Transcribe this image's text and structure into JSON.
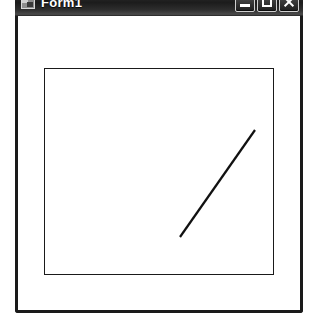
{
  "window": {
    "title": "Form1",
    "icon": "form-app-icon",
    "frame_color": "#1a1a1a",
    "titlebar_color": "#262626",
    "titlebar_text_color": "#ffffff",
    "client_background": "#ffffff"
  },
  "controls": {
    "minimize": {
      "name": "minimize-button",
      "icon": "minimize-icon",
      "label": "Minimize"
    },
    "maximize": {
      "name": "maximize-button",
      "icon": "maximize-icon",
      "label": "Maximize"
    },
    "close": {
      "name": "close-button",
      "icon": "close-icon",
      "label": "Close"
    }
  },
  "canvas": {
    "rectangle": {
      "name": "drawn-rectangle",
      "x": 26,
      "y": 52,
      "width": 230,
      "height": 207,
      "stroke": "#1a1a1a",
      "stroke_width": 1,
      "fill": "none"
    },
    "line": {
      "name": "drawn-line",
      "x1": 162,
      "y1": 221,
      "x2": 237,
      "y2": 114,
      "stroke": "#111111",
      "stroke_width": 2.2
    }
  }
}
